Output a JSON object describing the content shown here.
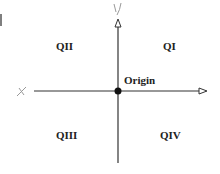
{
  "diagram": {
    "axes": {
      "x_label": "x",
      "y_label": "y"
    },
    "quadrants": {
      "q1": "QI",
      "q2": "QII",
      "q3": "QIII",
      "q4": "QIV"
    },
    "origin_label": "Origin",
    "colors": {
      "axis": "#333333",
      "text": "#222222",
      "handwriting": "#999999"
    }
  }
}
